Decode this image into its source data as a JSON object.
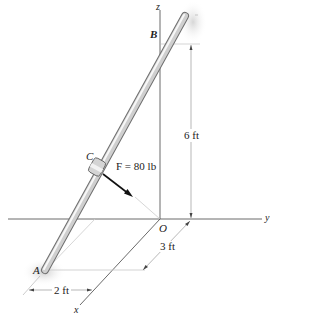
{
  "diagram": {
    "axes": {
      "x": "x",
      "y": "y",
      "z": "z",
      "origin": "O"
    },
    "points": {
      "A": "A",
      "B": "B",
      "C": "C"
    },
    "force": {
      "label": "F = 80 lb",
      "name": "F",
      "magnitude": "80 lb"
    },
    "dimensions": {
      "height": "6 ft",
      "depth": "3 ft",
      "width": "2 ft"
    },
    "colors": {
      "rod": "#b8b8b8",
      "rod_highlight": "#f2f2f2",
      "axis": "#333333",
      "dim_line": "#9a9a9a",
      "shadow": "#d9d9d9"
    }
  }
}
